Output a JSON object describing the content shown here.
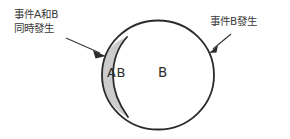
{
  "figure": {
    "type": "venn-diagram",
    "background_color": "#ffffff",
    "stroke_color": "#2b2b2b",
    "shaded_fill_color": "#cccccc",
    "unshaded_fill_color": "#ffffff",
    "text_color": "#3a3a3a"
  },
  "annotations": {
    "left": {
      "line1": "事件A和B",
      "line2": "同時發生",
      "full_text": "事件A和B同時發生",
      "points_to": "AB"
    },
    "right": {
      "line1": "事件B發生",
      "full_text": "事件B發生",
      "points_to": "B"
    }
  },
  "regions": [
    {
      "id": "intersection",
      "label": "AB",
      "fill": "#cccccc",
      "description": "lens-shaped shaded region on the left of circle B"
    },
    {
      "id": "event-b-only",
      "label": "B",
      "fill": "#ffffff",
      "description": "remaining unshaded interior of circle B"
    }
  ],
  "shapes": {
    "circle_b": {
      "center_x": 158,
      "center_y": 75,
      "radius_x": 56,
      "radius_y": 54.5
    },
    "lens": {
      "top_vertex_x": 127,
      "top_vertex_y": 37,
      "bottom_vertex_x": 128,
      "bottom_vertex_y": 117,
      "left_extent_x": 102
    }
  },
  "arrows": [
    {
      "id": "arrow-left",
      "from_x": 66,
      "from_y": 38,
      "to_x": 106,
      "to_y": 56,
      "target": "AB"
    },
    {
      "id": "arrow-right",
      "from_x": 230,
      "from_y": 35,
      "to_x": 210,
      "to_y": 53,
      "target": "B"
    }
  ]
}
